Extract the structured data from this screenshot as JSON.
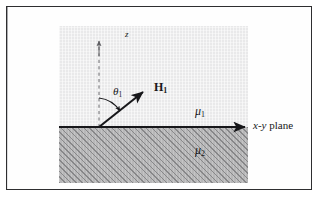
{
  "figure": {
    "kind": "physics-diagram",
    "labels": {
      "z_axis": "z",
      "incidence_angle": "θ",
      "incidence_angle_sub": "1",
      "field_vector": "H",
      "field_vector_sub": "1",
      "upper_medium": "μ",
      "upper_medium_sub": "1",
      "lower_medium": "μ",
      "lower_medium_sub": "2",
      "plane_italic": "x-y",
      "plane_rest": " plane"
    },
    "colors": {
      "upper_region": "#e9e9ea",
      "lower_region": "#b7b7b8",
      "hatch": "#767678",
      "ink": "#17171a",
      "frame": "#2e2e30",
      "page": "#ffffff"
    },
    "geometry": {
      "origin_x": 40,
      "origin_y": 101,
      "z_axis_top_y": 14,
      "vector_tip_x": 82,
      "vector_tip_y": 69,
      "interface_y": 101,
      "interface_start_x": 0,
      "interface_end_x": 189,
      "arc_radius": 28
    }
  }
}
